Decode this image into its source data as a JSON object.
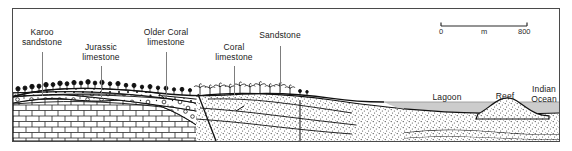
{
  "figure": {
    "type": "geological-cross-section",
    "title_present": false,
    "frame": {
      "border_color": "#4a4a4a"
    }
  },
  "scale_bar": {
    "name": "scale-bar",
    "start_label": "0",
    "unit_label": "m",
    "end_label": "800",
    "x_start_px": 441,
    "x_end_px": 527,
    "y_px": 26
  },
  "labels": [
    {
      "id": "karoo-sandstone",
      "text": "Karoo\nsandstone",
      "cx": 42,
      "ty": 28,
      "leader_top": 52,
      "leader_bottom": 96
    },
    {
      "id": "jurassic-limestone",
      "text": "Jurassic\nlimestone",
      "cx": 101,
      "ty": 43,
      "leader_top": 66,
      "leader_bottom": 97
    },
    {
      "id": "older-coral-limestone",
      "text": "Older Coral\nlimestone",
      "cx": 166,
      "ty": 28,
      "leader_top": 52,
      "leader_bottom": 98
    },
    {
      "id": "coral-limestone",
      "text": "Coral\nlimestone",
      "cx": 234,
      "ty": 43,
      "leader_top": 66,
      "leader_bottom": 95
    },
    {
      "id": "sandstone",
      "text": "Sandstone",
      "cx": 280,
      "ty": 31,
      "leader_top": 46,
      "leader_bottom": 92
    }
  ],
  "feature_labels": [
    {
      "id": "lagoon",
      "text": "Lagoon",
      "cx": 447,
      "ty": 93
    },
    {
      "id": "reef",
      "text": "Reef",
      "cx": 505,
      "ty": 92
    },
    {
      "id": "indian-ocean",
      "text": "Indian\nOcean",
      "cx": 543,
      "ty": 85
    }
  ],
  "colors": {
    "ink": "#111111",
    "water": "#c9c9c9",
    "leader": "#7d7d7d",
    "frame": "#4a4a4a",
    "stipple": "#222222",
    "page": "#ffffff"
  },
  "units": [
    {
      "name": "karoo-sandstone",
      "pattern": "stipple-dots"
    },
    {
      "name": "jurassic-limestone",
      "pattern": "brick-limestone"
    },
    {
      "name": "older-coral-limestone",
      "pattern": "rings-coral"
    },
    {
      "name": "coral-limestone",
      "pattern": "rings-coral"
    },
    {
      "name": "sandstone",
      "pattern": "fine-stipple"
    },
    {
      "name": "reef",
      "pattern": "fine-stipple"
    }
  ],
  "surface_features": {
    "trees_inland": "bush-tree-symbols",
    "trees_coastal": "palm-tree-symbols",
    "water_body": "sea-level-band"
  }
}
